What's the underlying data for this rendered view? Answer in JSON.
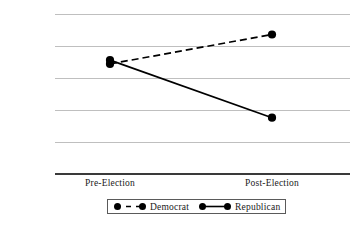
{
  "chart_data": {
    "type": "line",
    "title": "",
    "xlabel": "",
    "ylabel": "% of Americans",
    "categories": [
      "Pre-Election",
      "Post-Election"
    ],
    "ylim": [
      10,
      35
    ],
    "yticks": [
      10,
      15,
      20,
      25,
      30,
      35
    ],
    "ytick_labels": [
      "10",
      "15",
      "20",
      "25",
      "30",
      "35"
    ],
    "grid": true,
    "legend_position": "bottom",
    "series": [
      {
        "name": "Democrat",
        "values": [
          27.2,
          31.8
        ],
        "line_style": "dashed",
        "marker": "circle",
        "color": "#000000"
      },
      {
        "name": "Republican",
        "values": [
          27.8,
          18.8
        ],
        "line_style": "solid",
        "marker": "circle",
        "color": "#000000"
      }
    ]
  },
  "axes": {
    "y_title": "% of Americans",
    "y_ticks": [
      "35",
      "30",
      "25",
      "20",
      "15",
      "10"
    ],
    "x_ticks": [
      "Pre-Election",
      "Post-Election"
    ]
  },
  "legend": {
    "items": [
      {
        "label": "Democrat",
        "style": "dashed"
      },
      {
        "label": "Republican",
        "style": "solid"
      }
    ]
  },
  "colors": {
    "series": "#000000",
    "gridline": "#bfbfbf",
    "axis": "#3a3a3a",
    "text": "#1a1a1a",
    "background": "#ffffff"
  }
}
